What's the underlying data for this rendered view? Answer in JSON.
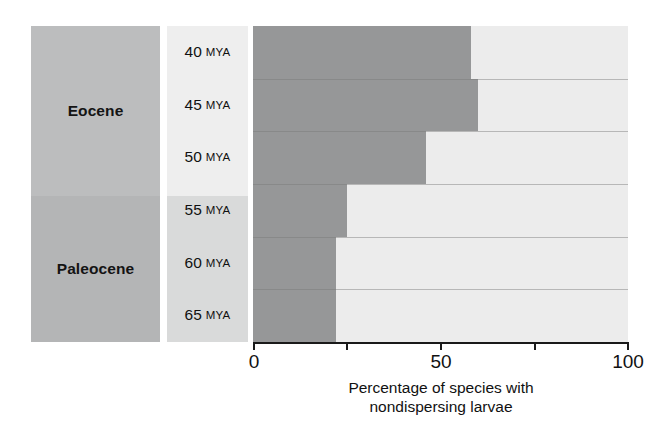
{
  "chart_data": {
    "type": "bar",
    "orientation": "horizontal",
    "title": "",
    "xlabel": "Percentage of species with nondispersing larvae",
    "ylabel": "",
    "xlim": [
      0,
      100
    ],
    "xticks": [
      0,
      25,
      50,
      75,
      100
    ],
    "xtick_labels": [
      "0",
      "",
      "50",
      "",
      "100"
    ],
    "grid": false,
    "legend": "none",
    "categories": [
      "40 MYA",
      "45 MYA",
      "50 MYA",
      "55 MYA",
      "60 MYA",
      "65 MYA"
    ],
    "values": [
      58,
      60,
      46,
      25,
      22,
      22
    ],
    "series": [
      {
        "name": "Nondispersing larvae",
        "values": [
          58,
          60,
          46,
          25,
          22,
          22
        ],
        "color": "#969798"
      },
      {
        "name": "Remainder",
        "values": [
          42,
          40,
          54,
          75,
          78,
          78
        ],
        "color": "#ececec"
      }
    ],
    "groups": [
      {
        "label": "Eocene",
        "categories": [
          "40 MYA",
          "45 MYA",
          "50 MYA"
        ]
      },
      {
        "label": "Paleocene",
        "categories": [
          "55 MYA",
          "60 MYA",
          "65 MYA"
        ]
      }
    ]
  },
  "epochs": [
    {
      "label": "Eocene"
    },
    {
      "label": "Paleocene"
    }
  ],
  "rows": [
    {
      "age": "40",
      "unit": "MYA",
      "value": 58
    },
    {
      "age": "45",
      "unit": "MYA",
      "value": 60
    },
    {
      "age": "50",
      "unit": "MYA",
      "value": 46
    },
    {
      "age": "55",
      "unit": "MYA",
      "value": 25
    },
    {
      "age": "60",
      "unit": "MYA",
      "value": 22
    },
    {
      "age": "65",
      "unit": "MYA",
      "value": 22
    }
  ],
  "axis": {
    "tick_0": "0",
    "tick_50": "50",
    "tick_100": "100"
  },
  "caption": {
    "line1": "Percentage of species with",
    "line2": "nondispersing larvae"
  },
  "colors": {
    "bar_fill": "#969798",
    "bar_rest": "#ececec",
    "epoch_block": "#bcbdbe",
    "mya_block_top": "#eeeeee",
    "mya_block_bottom": "#d9dada",
    "axis": "#1a1a1a",
    "text": "#111111"
  }
}
